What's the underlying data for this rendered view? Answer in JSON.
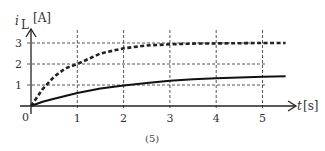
{
  "chart_data": {
    "type": "line",
    "title": "",
    "caption": "(5)",
    "xlabel": "t",
    "xunit": "[s]",
    "ylabel": "i",
    "ylabel_sub": "L",
    "yunit": "[A]",
    "origin_label": "0",
    "xlim": [
      0,
      5.7
    ],
    "ylim": [
      0,
      3.5
    ],
    "xticks": [
      1,
      2,
      3,
      4,
      5
    ],
    "xtick_labels": [
      "1",
      "2",
      "3",
      "4",
      "5"
    ],
    "yticks": [
      1,
      2,
      3
    ],
    "ytick_labels": [
      "1",
      "2",
      "3"
    ],
    "grid": "dashed",
    "legend": "none",
    "series": [
      {
        "name": "dashed",
        "style": "dashed",
        "color": "#222222",
        "x": [
          0,
          0.25,
          0.5,
          0.75,
          1,
          1.5,
          2,
          2.5,
          3,
          3.5,
          4,
          4.5,
          5,
          5.5
        ],
        "y": [
          0,
          0.8,
          1.4,
          1.8,
          2.0,
          2.5,
          2.75,
          2.88,
          2.94,
          2.97,
          2.98,
          2.99,
          3.0,
          3.0
        ]
      },
      {
        "name": "solid",
        "style": "solid",
        "color": "#111111",
        "x": [
          0,
          0.25,
          0.5,
          1,
          1.5,
          2,
          2.5,
          3,
          3.5,
          4,
          4.5,
          5,
          5.5
        ],
        "y": [
          0,
          0.2,
          0.35,
          0.62,
          0.83,
          0.98,
          1.1,
          1.2,
          1.27,
          1.32,
          1.36,
          1.39,
          1.42
        ]
      }
    ]
  }
}
